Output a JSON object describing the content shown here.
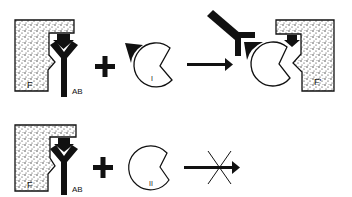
{
  "diagram": {
    "rows": [
      {
        "id": "row-1",
        "complex_label_surface": "F",
        "complex_label_antibody": "AB",
        "operator": "+",
        "enzyme_label": "I",
        "arrow": "proceeds",
        "product_surface_label": "F'"
      },
      {
        "id": "row-2",
        "complex_label_surface": "F",
        "complex_label_antibody": "AB",
        "operator": "+",
        "enzyme_label": "II",
        "arrow": "blocked"
      }
    ],
    "colors": {
      "ink": "#111111",
      "background": "#ffffff",
      "stipple": "#222222"
    }
  }
}
